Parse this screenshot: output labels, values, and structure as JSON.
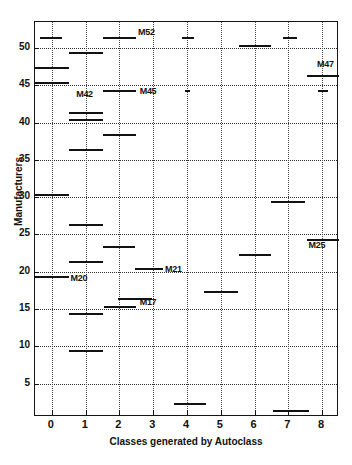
{
  "chart_data": {
    "type": "bar",
    "title": "",
    "xlabel": "Classes generated by Autoclass",
    "ylabel": "Manufacturers",
    "xlim": [
      -0.5,
      8.5
    ],
    "ylim": [
      53.5,
      0.5
    ],
    "xticks": [
      0,
      1,
      2,
      3,
      4,
      5,
      6,
      7,
      8
    ],
    "yticks": [
      5,
      10,
      15,
      20,
      25,
      30,
      35,
      40,
      45,
      50
    ],
    "grid": true,
    "legend": "none",
    "segments": [
      {
        "manufacturer": 2,
        "class": 7,
        "x_start": 6.55,
        "x_end": 7.6
      },
      {
        "manufacturer": 3,
        "class": 4,
        "x_start": 3.6,
        "x_end": 4.55
      },
      {
        "manufacturer": 10,
        "class": 1,
        "x_start": 0.5,
        "x_end": 1.5
      },
      {
        "manufacturer": 15,
        "class": 1,
        "x_start": 0.5,
        "x_end": 1.5
      },
      {
        "manufacturer": 16,
        "class": 2,
        "x_start": 1.55,
        "x_end": 2.5
      },
      {
        "manufacturer": 17,
        "class": 2,
        "x_start": 1.95,
        "x_end": 2.95
      },
      {
        "manufacturer": 18,
        "class": 5,
        "x_start": 4.5,
        "x_end": 5.5
      },
      {
        "manufacturer": 20,
        "class": 0,
        "x_start": -0.5,
        "x_end": 0.5
      },
      {
        "manufacturer": 21,
        "class": 3,
        "x_start": 2.45,
        "x_end": 3.3
      },
      {
        "manufacturer": 22,
        "class": 1,
        "x_start": 0.5,
        "x_end": 1.5
      },
      {
        "manufacturer": 23,
        "class": 6,
        "x_start": 5.55,
        "x_end": 6.5
      },
      {
        "manufacturer": 24,
        "class": 2,
        "x_start": 1.5,
        "x_end": 2.45
      },
      {
        "manufacturer": 25,
        "class": 8,
        "x_start": 7.55,
        "x_end": 8.5
      },
      {
        "manufacturer": 27,
        "class": 1,
        "x_start": 0.5,
        "x_end": 1.5
      },
      {
        "manufacturer": 30,
        "class": 7,
        "x_start": 6.5,
        "x_end": 7.5
      },
      {
        "manufacturer": 31,
        "class": 0,
        "x_start": -0.5,
        "x_end": 0.5
      },
      {
        "manufacturer": 37,
        "class": 1,
        "x_start": 0.5,
        "x_end": 1.5
      },
      {
        "manufacturer": 39,
        "class": 2,
        "x_start": 1.5,
        "x_end": 2.5
      },
      {
        "manufacturer": 41,
        "class": 1,
        "x_start": 0.5,
        "x_end": 1.5
      },
      {
        "manufacturer": 42,
        "class": 1,
        "x_start": 0.5,
        "x_end": 1.5
      },
      {
        "manufacturer": 45,
        "class": 2,
        "x_start": 1.5,
        "x_end": 2.5
      },
      {
        "manufacturer": 45,
        "class": 4,
        "x_start": 3.93,
        "x_end": 4.1
      },
      {
        "manufacturer": 45,
        "class": 8,
        "x_start": 7.88,
        "x_end": 8.18
      },
      {
        "manufacturer": 46,
        "class": 0,
        "x_start": -0.5,
        "x_end": 0.5
      },
      {
        "manufacturer": 47,
        "class": 8,
        "x_start": 7.55,
        "x_end": 8.5
      },
      {
        "manufacturer": 48,
        "class": 0,
        "x_start": -0.5,
        "x_end": 0.5
      },
      {
        "manufacturer": 50,
        "class": 1,
        "x_start": 0.5,
        "x_end": 1.5
      },
      {
        "manufacturer": 52,
        "class": 0,
        "x_start": -0.35,
        "x_end": 0.3
      },
      {
        "manufacturer": 52,
        "class": 2,
        "x_start": 1.5,
        "x_end": 2.5
      },
      {
        "manufacturer": 52,
        "class": 4,
        "x_start": 3.85,
        "x_end": 4.2
      },
      {
        "manufacturer": 51,
        "class": 6,
        "x_start": 5.55,
        "x_end": 6.5
      },
      {
        "manufacturer": 52,
        "class": 7,
        "x_start": 6.85,
        "x_end": 7.25
      }
    ],
    "annotations": [
      {
        "text": "M20",
        "x": 0.55,
        "y": 19.2
      },
      {
        "text": "M17",
        "x": 2.6,
        "y": 15.9
      },
      {
        "text": "M21",
        "x": 3.35,
        "y": 20.4
      },
      {
        "text": "M25",
        "x": 7.6,
        "y": 23.6
      },
      {
        "text": "M42",
        "x": 0.72,
        "y": 43.8
      },
      {
        "text": "M45",
        "x": 2.6,
        "y": 44.3
      },
      {
        "text": "M47",
        "x": 7.85,
        "y": 47.9
      },
      {
        "text": "M52",
        "x": 2.55,
        "y": 52.2
      }
    ],
    "colors": {
      "bar_fill": "#6d6d6d",
      "bar_edge": "#111111",
      "grid": "#2a2a2a",
      "axis": "#151515",
      "text": "#111111",
      "background": "#ffffff"
    }
  }
}
